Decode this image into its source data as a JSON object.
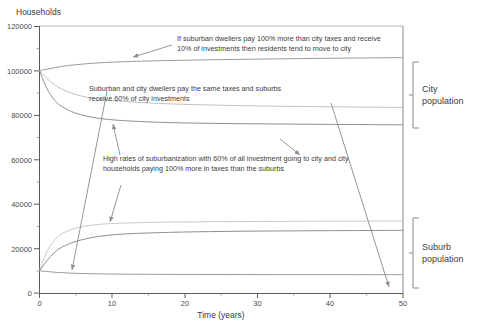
{
  "chart_data": {
    "type": "line",
    "title": "",
    "ylabel": "Households",
    "xlabel": "Time (years)",
    "xlim": [
      0,
      50
    ],
    "ylim": [
      0,
      120000
    ],
    "xticks": [
      "0",
      "10",
      "20",
      "30",
      "40",
      "50"
    ],
    "xtick_values": [
      0,
      10,
      20,
      30,
      40,
      50
    ],
    "yticks": [
      "0",
      "20000",
      "40000",
      "60000",
      "80000",
      "100000",
      "120000"
    ],
    "ytick_values": [
      0,
      20000,
      40000,
      60000,
      80000,
      100000,
      120000
    ],
    "y_minor_step": 10000,
    "grid": false,
    "legend_position": "none",
    "series": [
      {
        "name": "city-scenario-1-low-sub-investment",
        "group": "City population",
        "color": "#9a9a9a",
        "x": [
          0,
          1,
          2,
          3,
          5,
          8,
          12,
          18,
          25,
          32,
          40,
          50
        ],
        "values": [
          100000,
          100600,
          101200,
          101800,
          102600,
          103400,
          104000,
          104500,
          104900,
          105200,
          105500,
          105800
        ]
      },
      {
        "name": "city-scenario-2-equal-taxes-60pct-suburb-investment",
        "group": "City population",
        "color": "#c2c2c2",
        "x": [
          0,
          1,
          2,
          3,
          5,
          8,
          12,
          18,
          25,
          32,
          40,
          50
        ],
        "values": [
          100000,
          96500,
          93800,
          91800,
          89200,
          87200,
          86000,
          85000,
          84400,
          84000,
          83700,
          83400
        ]
      },
      {
        "name": "city-scenario-3-high-suburbanization",
        "group": "City population",
        "color": "#8f8f8f",
        "x": [
          0,
          1,
          2,
          3,
          5,
          8,
          12,
          18,
          25,
          32,
          40,
          50
        ],
        "values": [
          100000,
          92000,
          87000,
          84000,
          80800,
          78600,
          77400,
          76600,
          76200,
          76000,
          75800,
          75600
        ]
      },
      {
        "name": "suburb-scenario-2-equal-taxes-60pct-suburb-investment",
        "group": "Suburb population",
        "color": "#c9c9c9",
        "x": [
          0,
          1,
          2,
          3,
          5,
          8,
          12,
          18,
          25,
          32,
          40,
          50
        ],
        "values": [
          10000,
          18500,
          23500,
          26500,
          29200,
          30800,
          31500,
          31900,
          32100,
          32200,
          32300,
          32400
        ]
      },
      {
        "name": "suburb-scenario-3-high-suburbanization",
        "group": "Suburb population",
        "color": "#8f8f8f",
        "x": [
          0,
          1,
          2,
          3,
          5,
          8,
          12,
          18,
          25,
          32,
          40,
          50
        ],
        "values": [
          10000,
          14500,
          18000,
          20500,
          23200,
          25400,
          26600,
          27300,
          27700,
          27900,
          28050,
          28200
        ]
      },
      {
        "name": "suburb-scenario-1-low-sub-investment",
        "group": "Suburb population",
        "color": "#9a9a9a",
        "x": [
          0,
          1,
          2,
          3,
          5,
          8,
          12,
          18,
          25,
          32,
          40,
          50
        ],
        "values": [
          10000,
          9700,
          9400,
          9200,
          8900,
          8650,
          8500,
          8400,
          8350,
          8320,
          8300,
          8280
        ]
      }
    ],
    "annotations": [
      {
        "name": "annotation-move-to-city",
        "lines": [
          "If suburban dwellers pay 100% more than city taxes and receive",
          "10% of investments then residents tend to move to city"
        ]
      },
      {
        "name": "annotation-same-taxes",
        "lines": [
          "Suburban and city dwellers pay the same taxes and suburbs",
          "receive 60% of city investments"
        ]
      },
      {
        "name": "annotation-high-suburbanization",
        "lines": [
          "High rates of suburbanization with 60% of all investment going to city and city",
          "households paying 100% more in taxes than the suburbs"
        ]
      }
    ],
    "group_brackets": [
      {
        "name": "city-population-bracket",
        "label_line1": "City",
        "label_line2": "population"
      },
      {
        "name": "suburb-population-bracket",
        "label_line1": "Suburb",
        "label_line2": "population"
      }
    ],
    "colors": {
      "axis": "#5a5a5a",
      "text": "#3d3d3d",
      "leader": "#8a8a8a",
      "light_series": "#c9c9c9",
      "dark_series": "#8f8f8f"
    }
  }
}
